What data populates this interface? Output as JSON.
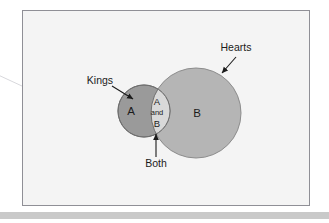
{
  "figure": {
    "type": "venn-diagram",
    "background_color": "#ffffff",
    "frame": {
      "name": "diagram-frame",
      "x": 22,
      "y": 10,
      "width": 288,
      "height": 196,
      "fill": "#f4f4f4",
      "border_color": "#8f8f96",
      "border_width": 1
    },
    "page_shadow_bar": {
      "name": "page-bottom-shadow",
      "x": 0,
      "y": 212,
      "width": 329,
      "height": 7,
      "color": "#c9c9c9"
    },
    "stray_line": {
      "name": "stray-diagonal-line",
      "x1": -4,
      "y1": 74,
      "x2": 104,
      "y2": 124,
      "color": "#d8d8dc",
      "width": 1
    }
  },
  "sets": [
    {
      "id": "A",
      "name": "circle-kings",
      "inner_label": "A",
      "callout_label": "Kings",
      "cx": 144,
      "cy": 111,
      "r": 26,
      "fill": "#9a9a9a",
      "stroke": "#6f6f6f",
      "label_x": 131,
      "label_y": 115,
      "callout_x": 100,
      "callout_y": 84,
      "arrow": {
        "x1": 119,
        "y1": 87,
        "x2": 133,
        "y2": 97
      }
    },
    {
      "id": "B",
      "name": "circle-hearts",
      "inner_label": "B",
      "callout_label": "Hearts",
      "cx": 196,
      "cy": 113,
      "r": 45,
      "fill": "#b5b5b5",
      "stroke": "#8c8c8c",
      "label_x": 193,
      "label_y": 117,
      "callout_x": 217,
      "callout_y": 51,
      "arrow": {
        "x1": 236,
        "y1": 58,
        "x2": 222,
        "y2": 74
      }
    }
  ],
  "intersection": {
    "name": "intersection-region",
    "fill": "#d9d9d9",
    "stroke": "#6f6f6f",
    "lines": [
      "A",
      "and",
      "B"
    ],
    "line_x": 157,
    "line_ys": [
      105,
      115,
      127
    ],
    "callout_label": "Both",
    "callout_x": 141,
    "callout_y": 163,
    "arrow": {
      "x1": 156,
      "y1": 155,
      "x2": 156,
      "y2": 134
    }
  },
  "colors": {
    "text": "#1b1b1b",
    "frame_fill": "#f4f4f4",
    "frame_border": "#8f8f96",
    "set_a_fill": "#9a9a9a",
    "set_b_fill": "#b5b5b5",
    "intersection_fill": "#d9d9d9",
    "arrow": "#1b1b1b"
  }
}
